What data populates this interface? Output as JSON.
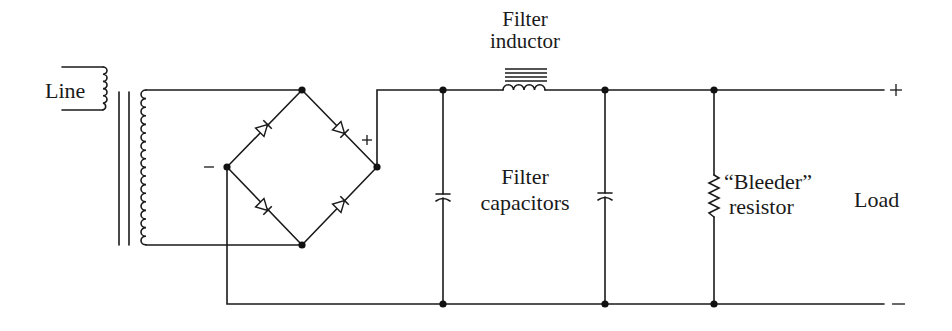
{
  "diagram": {
    "labels": {
      "line": "Line",
      "filter_inductor_1": "Filter",
      "filter_inductor_2": "inductor",
      "filter_capacitors_1": "Filter",
      "filter_capacitors_2": "capacitors",
      "bleeder_1": "“Bleeder”",
      "bleeder_2": "resistor",
      "load": "Load",
      "bridge_minus": "−",
      "bridge_plus": "+",
      "output_plus": "+",
      "output_minus": "−"
    },
    "components": [
      {
        "id": "transformer",
        "type": "transformer",
        "label": "Line"
      },
      {
        "id": "bridge",
        "type": "diode-bridge",
        "diodes": 4
      },
      {
        "id": "L1",
        "type": "inductor",
        "label": "Filter inductor"
      },
      {
        "id": "C1",
        "type": "capacitor",
        "label": "Filter capacitors"
      },
      {
        "id": "C2",
        "type": "capacitor",
        "label": "Filter capacitors"
      },
      {
        "id": "R1",
        "type": "resistor",
        "label": "Bleeder resistor"
      },
      {
        "id": "load",
        "type": "terminal",
        "label": "Load"
      }
    ],
    "colors": {
      "ink": "#1a1a1a",
      "background": "#ffffff"
    }
  }
}
